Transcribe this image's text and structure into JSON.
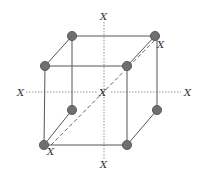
{
  "diagram": {
    "title": "",
    "colors": {
      "edge": "#555555",
      "axis": "#777777",
      "atom": "#6f6f6f",
      "label": "#333333"
    },
    "labels": {
      "axis_top": "X",
      "axis_bottom": "X",
      "axis_left": "X",
      "axis_right": "X",
      "center": "X",
      "diagonal_top": "X",
      "diagonal_bottom": "X"
    },
    "atoms": [
      {
        "name": "back-top-left"
      },
      {
        "name": "back-top-right"
      },
      {
        "name": "back-bottom-left"
      },
      {
        "name": "back-bottom-right"
      },
      {
        "name": "front-top-left"
      },
      {
        "name": "front-top-right"
      },
      {
        "name": "front-bottom-left"
      },
      {
        "name": "front-bottom-right"
      }
    ],
    "axes": [
      "vertical-axis",
      "horizontal-axis",
      "body-diagonal"
    ]
  }
}
